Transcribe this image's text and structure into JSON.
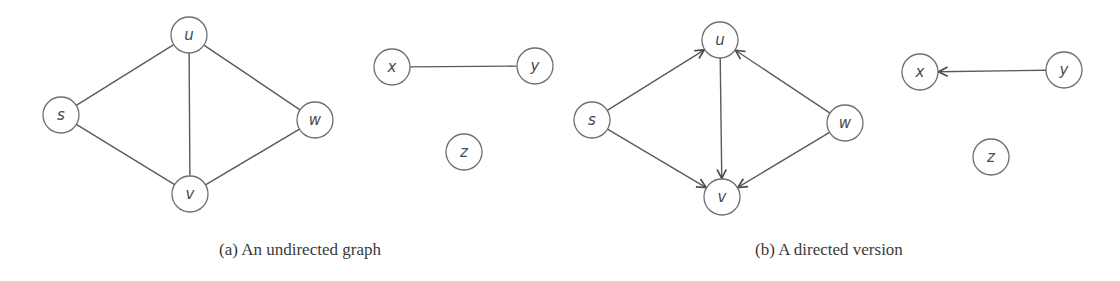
{
  "figure": {
    "node_radius": 18,
    "colors": {
      "edge": "#5a5a5a",
      "node_stroke": "#6e6e6e",
      "label": "#4a4a4a",
      "caption": "#3a3a3a"
    },
    "panels": [
      {
        "id": "a",
        "caption": "(a)  An undirected graph",
        "caption_pos": [
          300,
          255
        ],
        "directed": false,
        "nodes": [
          {
            "id": "u",
            "label": "u",
            "x": 189,
            "y": 35
          },
          {
            "id": "s",
            "label": "s",
            "x": 61,
            "y": 115
          },
          {
            "id": "w",
            "label": "w",
            "x": 315,
            "y": 120
          },
          {
            "id": "v",
            "label": "v",
            "x": 190,
            "y": 194
          },
          {
            "id": "x",
            "label": "x",
            "x": 392,
            "y": 67
          },
          {
            "id": "y",
            "label": "y",
            "x": 535,
            "y": 66
          },
          {
            "id": "z",
            "label": "z",
            "x": 464,
            "y": 152
          }
        ],
        "edges": [
          {
            "from": "s",
            "to": "u"
          },
          {
            "from": "u",
            "to": "w"
          },
          {
            "from": "u",
            "to": "v"
          },
          {
            "from": "s",
            "to": "v"
          },
          {
            "from": "w",
            "to": "v"
          },
          {
            "from": "x",
            "to": "y"
          }
        ]
      },
      {
        "id": "b",
        "caption": "(b)  A directed version",
        "caption_pos": [
          829,
          255
        ],
        "directed": true,
        "nodes": [
          {
            "id": "u",
            "label": "u",
            "x": 720,
            "y": 40
          },
          {
            "id": "s",
            "label": "s",
            "x": 592,
            "y": 120
          },
          {
            "id": "w",
            "label": "w",
            "x": 845,
            "y": 123
          },
          {
            "id": "v",
            "label": "v",
            "x": 722,
            "y": 197
          },
          {
            "id": "x",
            "label": "x",
            "x": 920,
            "y": 72
          },
          {
            "id": "y",
            "label": "y",
            "x": 1064,
            "y": 70
          },
          {
            "id": "z",
            "label": "z",
            "x": 991,
            "y": 157
          }
        ],
        "edges": [
          {
            "from": "s",
            "to": "u"
          },
          {
            "from": "w",
            "to": "u"
          },
          {
            "from": "u",
            "to": "v"
          },
          {
            "from": "s",
            "to": "v"
          },
          {
            "from": "w",
            "to": "v"
          },
          {
            "from": "y",
            "to": "x"
          }
        ]
      }
    ]
  }
}
